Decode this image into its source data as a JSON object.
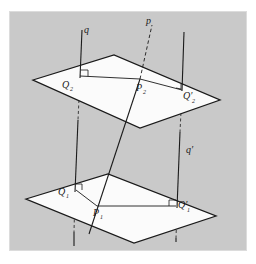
{
  "figure": {
    "background_color": "#c9c9c9",
    "page_color": "#ffffff",
    "plane_fill": "#fbfbfb",
    "line_color": "#1a1a1a",
    "panel": {
      "x": 10,
      "y": 12,
      "width": 236,
      "height": 238
    }
  },
  "labels": {
    "line_p": "p",
    "line_q": "q",
    "line_q_prime": "q′",
    "point_P2": "P",
    "point_P2_sub": "2",
    "point_Q2": "Q",
    "point_Q2_sub": "2",
    "point_Q2_prime": "Q′",
    "point_Q2_prime_sub": "2",
    "point_P1": "P",
    "point_P1_sub": "1",
    "point_Q1": "Q",
    "point_Q1_sub": "1",
    "point_Q1_prime": "Q′",
    "point_Q1_prime_sub": "1"
  },
  "geometry": {
    "upper_plane": {
      "name": "upper-plane",
      "points": "33,80 114,55 220,100 140,128"
    },
    "lower_plane": {
      "name": "lower-plane",
      "points": "26,199 108,174 216,216 134,243"
    },
    "line_p": {
      "name": "line-p",
      "solid_from": {
        "x": 89,
        "y": 234
      },
      "solid_to": {
        "x": 140,
        "y": 79
      },
      "dashed_from": {
        "x": 140,
        "y": 79
      },
      "dashed_to": {
        "x": 152,
        "y": 25
      }
    },
    "line_q": {
      "name": "line-q",
      "from": {
        "x": 82,
        "y": 30
      },
      "to": {
        "x": 74,
        "y": 246
      }
    },
    "line_q_prime": {
      "name": "line-q-prime",
      "from": {
        "x": 184,
        "y": 32
      },
      "to": {
        "x": 177,
        "y": 242
      }
    },
    "segments": [
      {
        "name": "segment-Q2-P2",
        "x1": 80,
        "y1": 76,
        "x2": 140,
        "y2": 79
      },
      {
        "name": "segment-P2-Q2prime",
        "x1": 140,
        "y1": 79,
        "x2": 182,
        "y2": 90
      },
      {
        "name": "segment-Q1-P1",
        "x1": 76,
        "y1": 190,
        "x2": 97,
        "y2": 206
      },
      {
        "name": "segment-P1-Q1prime",
        "x1": 97,
        "y1": 206,
        "x2": 176,
        "y2": 206
      }
    ]
  },
  "markers": {
    "right_angle_Q2": "right-angle-mark",
    "right_angle_Q2_prime": "right-angle-mark",
    "right_angle_Q1": "right-angle-mark",
    "right_angle_Q1_prime": "right-angle-mark"
  }
}
